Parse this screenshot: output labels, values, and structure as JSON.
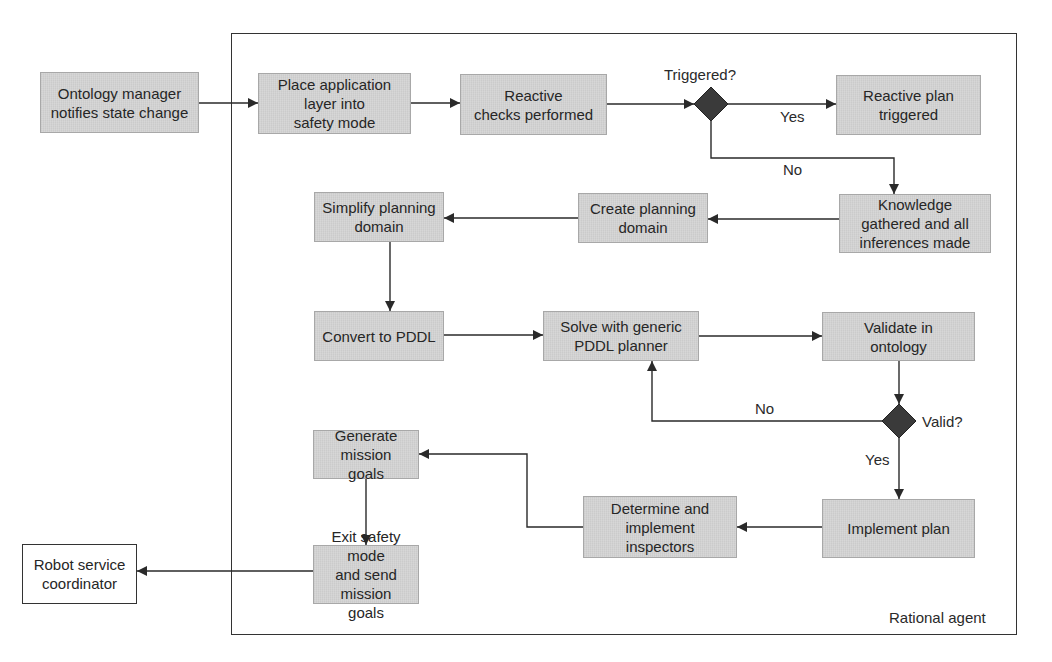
{
  "diagram": {
    "type": "flowchart",
    "container": {
      "label": "Rational agent",
      "x": 231,
      "y": 33,
      "w": 786,
      "h": 602
    },
    "colors": {
      "process_fill": "#d3d3d3",
      "decision_fill": "#3a3a3a",
      "line": "#2a2a2a",
      "external_fill": "#ffffff"
    },
    "nodes": [
      {
        "id": "ontology",
        "kind": "process",
        "text": "Ontology manager\nnotifies state change",
        "x": 40,
        "y": 72,
        "w": 159,
        "h": 61
      },
      {
        "id": "place",
        "kind": "process",
        "text": "Place application\nlayer into\nsafety mode",
        "x": 258,
        "y": 73,
        "w": 153,
        "h": 61
      },
      {
        "id": "reactive_checks",
        "kind": "process",
        "text": "Reactive\nchecks performed",
        "x": 460,
        "y": 74,
        "w": 147,
        "h": 61
      },
      {
        "id": "reactive_plan",
        "kind": "process",
        "text": "Reactive plan\ntriggered",
        "x": 836,
        "y": 75,
        "w": 145,
        "h": 60
      },
      {
        "id": "knowledge",
        "kind": "process",
        "text": "Knowledge\ngathered and all\ninferences made",
        "x": 839,
        "y": 194,
        "w": 152,
        "h": 59
      },
      {
        "id": "create",
        "kind": "process",
        "text": "Create planning\ndomain",
        "x": 578,
        "y": 193,
        "w": 130,
        "h": 50
      },
      {
        "id": "simplify",
        "kind": "process",
        "text": "Simplify planning\ndomain",
        "x": 314,
        "y": 192,
        "w": 130,
        "h": 50
      },
      {
        "id": "convert",
        "kind": "process",
        "text": "Convert to PDDL",
        "x": 314,
        "y": 311,
        "w": 130,
        "h": 50
      },
      {
        "id": "solve",
        "kind": "process",
        "text": "Solve with generic\nPDDL planner",
        "x": 543,
        "y": 311,
        "w": 156,
        "h": 50
      },
      {
        "id": "validate",
        "kind": "process",
        "text": "Validate in\nontology",
        "x": 822,
        "y": 312,
        "w": 153,
        "h": 49
      },
      {
        "id": "implement",
        "kind": "process",
        "text": "Implement plan",
        "x": 822,
        "y": 499,
        "w": 153,
        "h": 59
      },
      {
        "id": "determine",
        "kind": "process",
        "text": "Determine and\nimplement\ninspectors",
        "x": 583,
        "y": 496,
        "w": 154,
        "h": 62
      },
      {
        "id": "generate",
        "kind": "process",
        "text": "Generate mission\ngoals",
        "x": 313,
        "y": 430,
        "w": 106,
        "h": 49
      },
      {
        "id": "exit",
        "kind": "process",
        "text": "Exit safety mode\nand send mission\ngoals",
        "x": 313,
        "y": 545,
        "w": 106,
        "h": 59
      },
      {
        "id": "robot",
        "kind": "external",
        "text": "Robot service\ncoordinator",
        "x": 22,
        "y": 544,
        "w": 115,
        "h": 60
      }
    ],
    "decisions": [
      {
        "id": "triggered",
        "label": "Triggered?",
        "cx": 711,
        "cy": 104,
        "r": 17,
        "label_x": 664,
        "label_y": 66
      },
      {
        "id": "valid",
        "label": "Valid?",
        "cx": 899,
        "cy": 421,
        "r": 17,
        "label_x": 922,
        "label_y": 413
      }
    ],
    "edge_labels": [
      {
        "text": "Yes",
        "x": 780,
        "y": 108
      },
      {
        "text": "No",
        "x": 783,
        "y": 161
      },
      {
        "text": "No",
        "x": 755,
        "y": 400
      },
      {
        "text": "Yes",
        "x": 865,
        "y": 451
      }
    ],
    "edges": [
      {
        "from": "ontology",
        "to": "place",
        "points": [
          [
            199,
            103
          ],
          [
            258,
            103
          ]
        ]
      },
      {
        "from": "place",
        "to": "reactive_checks",
        "points": [
          [
            411,
            103
          ],
          [
            460,
            103
          ]
        ]
      },
      {
        "from": "reactive_checks",
        "to": "triggered",
        "points": [
          [
            607,
            104
          ],
          [
            694,
            104
          ]
        ]
      },
      {
        "from": "triggered",
        "to": "reactive_plan",
        "label": "Yes",
        "points": [
          [
            728,
            104
          ],
          [
            836,
            104
          ]
        ]
      },
      {
        "from": "triggered",
        "to": "knowledge",
        "label": "No",
        "points": [
          [
            711,
            121
          ],
          [
            711,
            158
          ],
          [
            894,
            158
          ],
          [
            894,
            194
          ]
        ]
      },
      {
        "from": "knowledge",
        "to": "create",
        "points": [
          [
            839,
            219
          ],
          [
            708,
            219
          ]
        ]
      },
      {
        "from": "create",
        "to": "simplify",
        "points": [
          [
            578,
            218
          ],
          [
            444,
            218
          ]
        ]
      },
      {
        "from": "simplify",
        "to": "convert",
        "points": [
          [
            390,
            242
          ],
          [
            390,
            311
          ]
        ]
      },
      {
        "from": "convert",
        "to": "solve",
        "points": [
          [
            444,
            335
          ],
          [
            543,
            335
          ]
        ]
      },
      {
        "from": "solve",
        "to": "validate",
        "points": [
          [
            699,
            336
          ],
          [
            822,
            336
          ]
        ]
      },
      {
        "from": "validate",
        "to": "valid",
        "points": [
          [
            899,
            361
          ],
          [
            899,
            404
          ]
        ]
      },
      {
        "from": "valid",
        "to": "solve",
        "label": "No",
        "points": [
          [
            882,
            421
          ],
          [
            652,
            421
          ],
          [
            652,
            361
          ]
        ]
      },
      {
        "from": "valid",
        "to": "implement",
        "label": "Yes",
        "points": [
          [
            899,
            438
          ],
          [
            899,
            499
          ]
        ]
      },
      {
        "from": "implement",
        "to": "determine",
        "points": [
          [
            822,
            527
          ],
          [
            737,
            527
          ]
        ]
      },
      {
        "from": "determine",
        "to": "generate",
        "points": [
          [
            583,
            527
          ],
          [
            527,
            527
          ],
          [
            527,
            454
          ],
          [
            419,
            454
          ]
        ]
      },
      {
        "from": "generate",
        "to": "exit",
        "points": [
          [
            366,
            479
          ],
          [
            366,
            545
          ]
        ]
      },
      {
        "from": "exit",
        "to": "robot",
        "points": [
          [
            313,
            571
          ],
          [
            137,
            571
          ]
        ]
      }
    ]
  }
}
